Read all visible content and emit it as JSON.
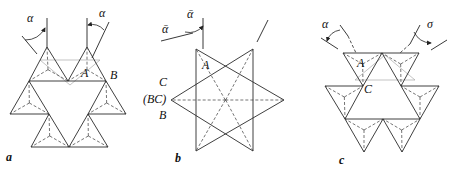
{
  "figure": {
    "panels": [
      {
        "id": "a",
        "label": "a",
        "label_pos": [
          6,
          161
        ],
        "angles": [
          {
            "label": "α",
            "pos": [
              27,
              22
            ],
            "vertical": [
              [
                47,
                18
              ],
              [
                47,
                47
              ]
            ],
            "slant": [
              [
                22,
                36
              ],
              [
                37,
                54
              ]
            ],
            "arc": [
              [
                25,
                40
              ],
              [
                45,
                28
              ]
            ]
          },
          {
            "label": "α",
            "pos": [
              99,
              17
            ],
            "vertical": [
              [
                87,
                18
              ],
              [
                87,
                47
              ]
            ],
            "slant": [
              [
                109,
                22
              ],
              [
                92,
                58
              ]
            ],
            "arc": [
              [
                104,
                30
              ],
              [
                88,
                25
              ]
            ]
          }
        ],
        "point_labels": [
          {
            "text": "A",
            "pos": [
              81,
              77
            ]
          },
          {
            "text": "B",
            "pos": [
              110,
              79
            ]
          }
        ],
        "triangles": [
          [
            [
              47,
              47
            ],
            [
              29,
              81
            ],
            [
              68,
              81
            ]
          ],
          [
            [
              87,
              47
            ],
            [
              68,
              81
            ],
            [
              106,
              81
            ]
          ],
          [
            [
              29,
              81
            ],
            [
              10,
              114
            ],
            [
              49,
              114
            ]
          ],
          [
            [
              106,
              81
            ],
            [
              88,
              114
            ],
            [
              126,
              114
            ]
          ],
          [
            [
              49,
              114
            ],
            [
              31,
              147
            ],
            [
              69,
              147
            ]
          ],
          [
            [
              88,
              114
            ],
            [
              69,
              147
            ],
            [
              108,
              147
            ]
          ]
        ],
        "ghost_triangles": [
          [
            [
              40,
              60
            ],
            [
              100,
              60
            ],
            [
              70,
              85
            ]
          ]
        ]
      },
      {
        "id": "b",
        "label": "b",
        "label_pos": [
          175,
          162
        ],
        "angles": [
          {
            "label": "ᾱ",
            "pos": [
              187,
              18
            ],
            "vertical": [
              [
                203,
                18
              ],
              [
                203,
                49
              ]
            ],
            "slant": [
              [
                161,
                41
              ],
              [
                193,
                33
              ]
            ],
            "arc": [
              [
                185,
                32
              ],
              [
                203,
                26
              ]
            ]
          },
          {
            "label": "ᾱ",
            "pos": [
              162,
              33
            ]
          }
        ],
        "extra_line": [
          [
            268,
            20
          ],
          [
            257,
            42
          ]
        ],
        "point_labels": [
          {
            "text": "A",
            "pos": [
              202,
              69
            ]
          },
          {
            "text": "C",
            "pos": [
              159,
              86
            ]
          },
          {
            "text": "(BC)",
            "pos": [
              143,
              103
            ]
          },
          {
            "text": "B",
            "pos": [
              159,
              119
            ]
          }
        ],
        "triangles": [
          [
            [
              196,
              49
            ],
            [
              284,
              100
            ],
            [
              196,
              151
            ]
          ],
          [
            [
              253,
              49
            ],
            [
              171,
              100
            ],
            [
              253,
              151
            ]
          ]
        ]
      },
      {
        "id": "c",
        "label": "c",
        "label_pos": [
          339,
          164
        ],
        "angles": [
          {
            "label": "α",
            "pos": [
              322,
              28
            ],
            "slant_solid": [
              [
                340,
                25
              ],
              [
                348,
                36
              ]
            ],
            "slant_dash": [
              [
                348,
                36
              ],
              [
                356,
                53
              ]
            ],
            "outer": [
              [
                321,
                38
              ],
              [
                338,
                49
              ]
            ],
            "arc": [
              [
                340,
                30
              ],
              [
                327,
                41
              ]
            ]
          },
          {
            "label": "σ",
            "pos": [
              427,
              28
            ],
            "slant_solid": [
              [
                420,
                25
              ],
              [
                410,
                44
              ]
            ],
            "slant_dash": [
              [
                410,
                44
              ],
              [
                400,
                53
              ]
            ],
            "outer": [
              [
                447,
                40
              ],
              [
                431,
                50
              ]
            ],
            "arc": [
              [
                414,
                32
              ],
              [
                431,
                43
              ]
            ]
          }
        ],
        "point_labels": [
          {
            "text": "A",
            "pos": [
              357,
              67
            ]
          },
          {
            "text": "C",
            "pos": [
              364,
              93
            ]
          }
        ],
        "triangles": [
          [
            [
              343,
              53
            ],
            [
              382,
              53
            ],
            [
              363,
              86
            ]
          ],
          [
            [
              382,
              53
            ],
            [
              419,
              53
            ],
            [
              401,
              86
            ]
          ],
          [
            [
              325,
              86
            ],
            [
              363,
              86
            ],
            [
              345,
              119
            ]
          ],
          [
            [
              401,
              86
            ],
            [
              439,
              86
            ],
            [
              420,
              119
            ]
          ],
          [
            [
              345,
              119
            ],
            [
              383,
              119
            ],
            [
              364,
              152
            ]
          ],
          [
            [
              383,
              119
            ],
            [
              420,
              119
            ],
            [
              402,
              152
            ]
          ]
        ],
        "ghost_triangles": [
          [
            [
              355,
              80
            ],
            [
              415,
              80
            ],
            [
              385,
              55
            ]
          ]
        ]
      }
    ]
  }
}
